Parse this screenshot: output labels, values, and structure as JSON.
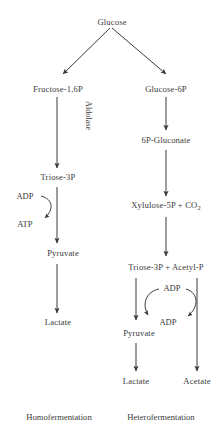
{
  "diagram": {
    "text_color": "#3b3b3b",
    "background_color": "#ffffff",
    "nodes": {
      "glucose": "Glucose",
      "fructose16p": "Fructose-1,6P",
      "glucose6p": "Glucose-6P",
      "triose3p_left": "Triose-3P",
      "pyruvate_left": "Pyruvate",
      "lactate_left": "Lactate",
      "gluconate": "6P-Gluconate",
      "xylulose5p": "Xylulose-5P + CO",
      "xylulose5p_sub": "2",
      "triose_acetyl": "Triose-3P  +  Acetyl-P",
      "pyruvate_right": "Pyruvate",
      "lactate_right": "Lactate",
      "acetate_right": "Acetate"
    },
    "enzymes": {
      "aldolase": "Aldolase"
    },
    "cofactors": {
      "adp_left": "ADP",
      "atp_left": "ATP",
      "adp_right_top": "ADP",
      "adp_right_bottom": "ADP"
    },
    "footers": {
      "homofermentation": "Homofermentation",
      "heterofermentation": "Heterofermentation"
    }
  }
}
